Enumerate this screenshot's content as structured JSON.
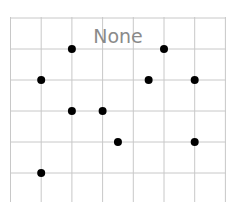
{
  "chart_data": {
    "type": "scatter",
    "title": "None",
    "xlabel": "",
    "ylabel": "",
    "grid": true,
    "legend": null,
    "xlim": [
      0,
      7
    ],
    "ylim": [
      0,
      6
    ],
    "x_gridlines": [
      0,
      1,
      2,
      3,
      4,
      5,
      6,
      7
    ],
    "y_gridlines": [
      1,
      2,
      3,
      4,
      5,
      6
    ],
    "points": [
      {
        "x": 1,
        "y": 4
      },
      {
        "x": 2,
        "y": 5
      },
      {
        "x": 5,
        "y": 5
      },
      {
        "x": 4.5,
        "y": 4
      },
      {
        "x": 6,
        "y": 4
      },
      {
        "x": 2,
        "y": 3
      },
      {
        "x": 3,
        "y": 3
      },
      {
        "x": 3.5,
        "y": 2
      },
      {
        "x": 6,
        "y": 2
      },
      {
        "x": 1,
        "y": 1
      }
    ],
    "marker_color": "#000000",
    "grid_color": "#c8c8c8",
    "title_color": "#8a8a8a"
  }
}
